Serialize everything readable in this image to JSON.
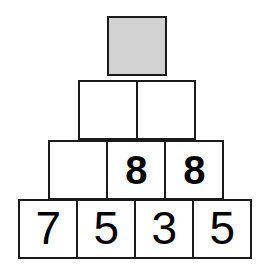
{
  "figure": {
    "name": "number-pyramid",
    "background_color": "#ffffff",
    "border_color": "#1a1a1a",
    "shaded_cell_color": "#d2d2d2",
    "digit_color": "#000000",
    "cell_size_px": 60
  },
  "rows": [
    {
      "id": "r1",
      "index": 1,
      "cells": [
        {
          "value": "",
          "shaded": true,
          "name": "pyramid-cell-r1-c1"
        }
      ]
    },
    {
      "id": "r2",
      "index": 2,
      "cells": [
        {
          "value": "",
          "shaded": false,
          "name": "pyramid-cell-r2-c1"
        },
        {
          "value": "",
          "shaded": false,
          "name": "pyramid-cell-r2-c2"
        }
      ]
    },
    {
      "id": "r3",
      "index": 3,
      "cells": [
        {
          "value": "",
          "shaded": false,
          "name": "pyramid-cell-r3-c1"
        },
        {
          "value": "8",
          "shaded": false,
          "name": "pyramid-cell-r3-c2"
        },
        {
          "value": "8",
          "shaded": false,
          "name": "pyramid-cell-r3-c3"
        }
      ]
    },
    {
      "id": "r4",
      "index": 4,
      "cells": [
        {
          "value": "7",
          "shaded": false,
          "name": "pyramid-cell-r4-c1"
        },
        {
          "value": "5",
          "shaded": false,
          "name": "pyramid-cell-r4-c2"
        },
        {
          "value": "3",
          "shaded": false,
          "name": "pyramid-cell-r4-c3"
        },
        {
          "value": "5",
          "shaded": false,
          "name": "pyramid-cell-r4-c4"
        }
      ]
    }
  ]
}
